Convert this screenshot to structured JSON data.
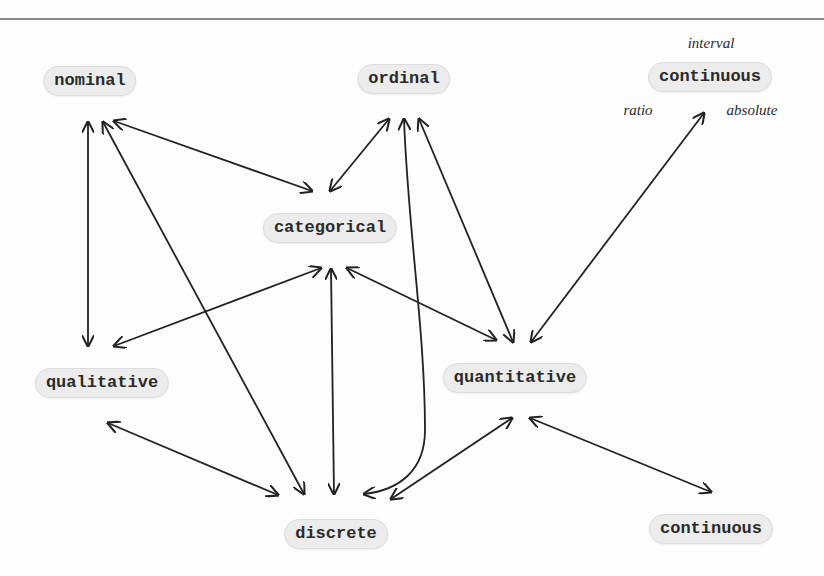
{
  "diagram": {
    "type": "graph",
    "directed": "bidirectional",
    "nodes": [
      {
        "id": "nominal",
        "label": "nominal",
        "x": 90,
        "y": 81
      },
      {
        "id": "ordinal",
        "label": "ordinal",
        "x": 404,
        "y": 79
      },
      {
        "id": "continuous_top",
        "label": "continuous",
        "x": 710,
        "y": 77
      },
      {
        "id": "categorical",
        "label": "categorical",
        "x": 330,
        "y": 228
      },
      {
        "id": "qualitative",
        "label": "qualitative",
        "x": 102,
        "y": 383
      },
      {
        "id": "quantitative",
        "label": "quantitative",
        "x": 515,
        "y": 378
      },
      {
        "id": "discrete",
        "label": "discrete",
        "x": 336,
        "y": 534
      },
      {
        "id": "continuous_bottom",
        "label": "continuous",
        "x": 711,
        "y": 529
      }
    ],
    "annotations": [
      {
        "id": "interval",
        "label": "interval",
        "x": 711,
        "y": 43
      },
      {
        "id": "ratio",
        "label": "ratio",
        "x": 638,
        "y": 110
      },
      {
        "id": "absolute",
        "label": "absolute",
        "x": 752,
        "y": 110
      }
    ],
    "edges": [
      {
        "from": "nominal",
        "to": "qualitative",
        "style": "straight"
      },
      {
        "from": "nominal",
        "to": "categorical",
        "style": "straight"
      },
      {
        "from": "nominal",
        "to": "discrete",
        "style": "straight"
      },
      {
        "from": "ordinal",
        "to": "categorical",
        "style": "straight"
      },
      {
        "from": "ordinal",
        "to": "discrete",
        "style": "curved"
      },
      {
        "from": "ordinal",
        "to": "quantitative",
        "style": "straight"
      },
      {
        "from": "continuous_top",
        "to": "quantitative",
        "style": "straight"
      },
      {
        "from": "categorical",
        "to": "qualitative",
        "style": "straight"
      },
      {
        "from": "categorical",
        "to": "discrete",
        "style": "straight"
      },
      {
        "from": "categorical",
        "to": "quantitative",
        "style": "straight"
      },
      {
        "from": "qualitative",
        "to": "discrete",
        "style": "straight"
      },
      {
        "from": "quantitative",
        "to": "discrete",
        "style": "straight"
      },
      {
        "from": "quantitative",
        "to": "continuous_bottom",
        "style": "straight"
      }
    ],
    "colors": {
      "edge": "#222222",
      "node_fill": "#ececec",
      "node_border": "#dcdcdc",
      "text": "#2a2a2a"
    }
  }
}
